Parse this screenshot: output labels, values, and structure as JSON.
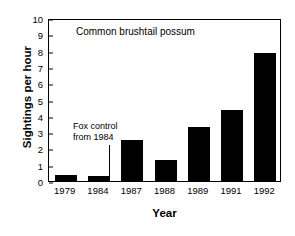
{
  "chart_data": {
    "type": "bar",
    "title": "Common brushtail possum",
    "xlabel": "Year",
    "ylabel": "Sightings per hour",
    "categories": [
      "1979",
      "1984",
      "1987",
      "1988",
      "1989",
      "1991",
      "1992"
    ],
    "values": [
      0.35,
      0.28,
      2.5,
      1.3,
      3.3,
      4.35,
      7.85
    ],
    "ylim": [
      0,
      10
    ],
    "yticks": [
      0,
      1,
      2,
      3,
      4,
      5,
      6,
      7,
      8,
      9,
      10
    ],
    "ytick_labels": [
      "0",
      "1",
      "2",
      "3",
      "4",
      "5",
      "6",
      "7",
      "8",
      "9",
      "10"
    ],
    "grid": false,
    "legend": "none",
    "bar_color": "#000000",
    "annotations": [
      {
        "text_line1": "Fox control",
        "text_line2": "from 1984",
        "points_to": "1984"
      }
    ]
  }
}
